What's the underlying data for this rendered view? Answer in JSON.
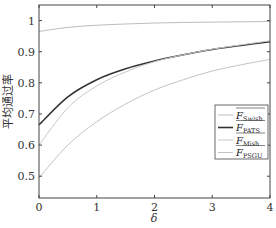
{
  "chart_data": {
    "type": "line",
    "title": "",
    "xlabel": "δ",
    "ylabel": "平均通过率",
    "xlim": [
      0,
      4
    ],
    "ylim": [
      0.43,
      1.05
    ],
    "xticks": [
      0,
      1,
      2,
      3,
      4
    ],
    "yticks": [
      0.5,
      0.6,
      0.7,
      0.8,
      0.9,
      1
    ],
    "xtick_labels": [
      "0",
      "1",
      "2",
      "3",
      "4"
    ],
    "ytick_labels": [
      "0.5",
      "0.6",
      "0.7",
      "0.8",
      "0.9",
      "1"
    ],
    "grid": false,
    "legend_position": "lower right",
    "x": [
      0,
      0.5,
      1,
      1.5,
      2,
      2.5,
      3,
      3.5,
      4
    ],
    "series": [
      {
        "name": "F_Swish",
        "label_main": "F",
        "label_sub": "Swish",
        "color": "#bdbdbd",
        "width": 1,
        "values": [
          0.965,
          0.978,
          0.985,
          0.989,
          0.992,
          0.994,
          0.995,
          0.996,
          0.997
        ]
      },
      {
        "name": "F_PATS",
        "label_main": "F",
        "label_sub": "PATS",
        "color": "#333333",
        "width": 1.6,
        "values": [
          0.665,
          0.755,
          0.81,
          0.845,
          0.87,
          0.89,
          0.907,
          0.92,
          0.932
        ]
      },
      {
        "name": "F_Mish",
        "label_main": "F",
        "label_sub": "Mish",
        "color": "#c8c8c8",
        "width": 1,
        "values": [
          0.6,
          0.72,
          0.79,
          0.835,
          0.868,
          0.89,
          0.908,
          0.922,
          0.935
        ]
      },
      {
        "name": "F_PSGU",
        "label_main": "F",
        "label_sub": "PSGU",
        "color": "#c4c4c4",
        "width": 1,
        "values": [
          0.495,
          0.6,
          0.675,
          0.732,
          0.777,
          0.81,
          0.838,
          0.858,
          0.875
        ]
      }
    ]
  }
}
